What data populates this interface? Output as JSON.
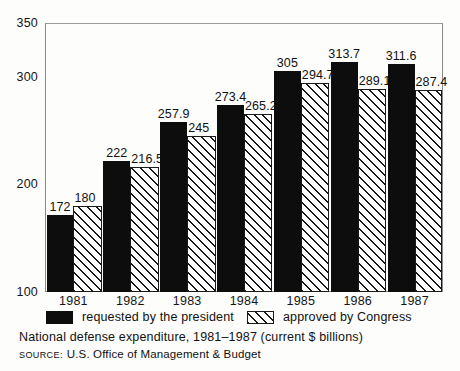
{
  "chart_data": {
    "type": "bar",
    "title": "",
    "caption": "National defense expenditure, 1981–1987 (current $ billions)",
    "source_label": "SOURCE:",
    "source_text": "U.S. Office of Management & Budget",
    "xlabel": "",
    "ylabel": "",
    "categories": [
      "1981",
      "1982",
      "1983",
      "1984",
      "1985",
      "1986",
      "1987"
    ],
    "yticks": [
      100,
      200,
      300,
      350
    ],
    "ytick_labels": [
      "100",
      "200",
      "300",
      "350"
    ],
    "ylim": [
      100,
      350
    ],
    "grid": false,
    "legend_position": "below-plot",
    "series": [
      {
        "name": "requested by the president",
        "pattern": "solid-black",
        "color": "#0d0d0d",
        "values": [
          172,
          222,
          257.9,
          273.4,
          305,
          313.7,
          311.6
        ],
        "value_labels": [
          "172",
          "222",
          "257.9",
          "273.4",
          "305",
          "313.7",
          "311.6"
        ]
      },
      {
        "name": "approved by Congress",
        "pattern": "diagonal-hatch",
        "color": "#ffffff",
        "values": [
          180,
          216.5,
          245,
          265.2,
          294.7,
          289.1,
          287.4
        ],
        "value_labels": [
          "180",
          "216.5",
          "245",
          "265.2",
          "294.7",
          "289.1",
          "287.4"
        ]
      }
    ]
  },
  "legend": [
    {
      "label": "requested by the president",
      "swatch": "solid"
    },
    {
      "label": "approved by Congress",
      "swatch": "hatched"
    }
  ]
}
